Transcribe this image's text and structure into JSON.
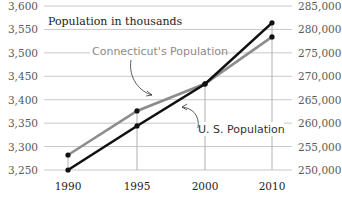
{
  "chart_data": {
    "type": "line",
    "title": "Population in thousands",
    "x": [
      1990,
      1995,
      2000,
      2010
    ],
    "x_tick_labels": [
      "1990",
      "1995",
      "2000",
      "2010"
    ],
    "series": [
      {
        "name": "Connecticut's Population",
        "axis": "left",
        "color": "#8c8c8c",
        "values": [
          3282,
          3376,
          3434,
          3534
        ]
      },
      {
        "name": "U. S. Population",
        "axis": "right",
        "color": "#111111",
        "values": [
          250000,
          259400,
          268350,
          281400
        ]
      }
    ],
    "left_axis": {
      "ticks": [
        "3,600",
        "3,550",
        "3,500",
        "3,450",
        "3,400",
        "3,350",
        "3,300",
        "3,250"
      ],
      "ylim": [
        3250,
        3600
      ]
    },
    "right_axis": {
      "ticks": [
        "285,000",
        "280,000",
        "275,000",
        "270,000",
        "265,000",
        "260,000",
        "255,000",
        "250,000"
      ],
      "ylim": [
        250000,
        285000
      ]
    },
    "grid": true,
    "annotations": [
      "Connecticut's Population",
      "U. S. Population"
    ]
  },
  "labels": {
    "title": "Population in thousands",
    "ct": "Connecticut's Population",
    "us": "U. S. Population"
  }
}
